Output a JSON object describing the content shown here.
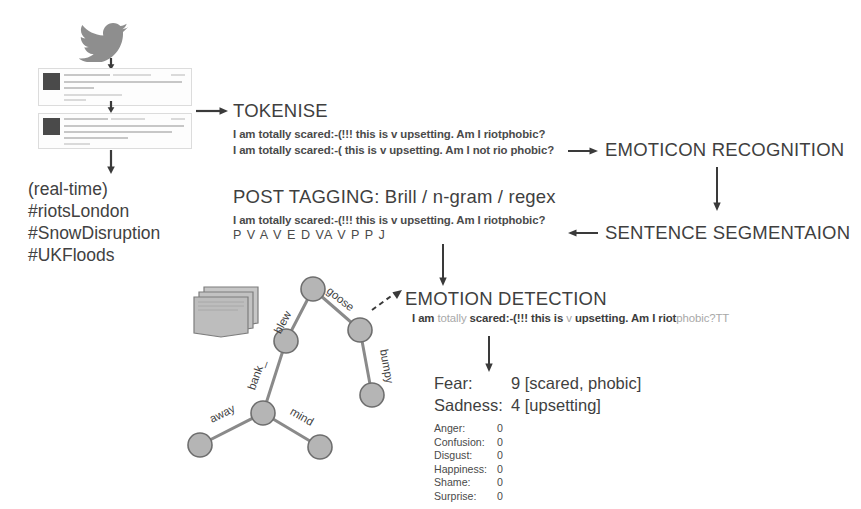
{
  "diagram": {
    "colors": {
      "text": "#3a3a3a",
      "node_fill": "#b5b5b5",
      "node_stroke": "#6e6e6e",
      "arrow": "#3a3a3a",
      "dim_text": "#a8a8a8",
      "doc_fill": "#bdbdbd"
    }
  },
  "source": {
    "logo_name": "twitter-bird-icon",
    "tweets": [
      {
        "id": 1,
        "caption": "tweet screenshot (blurred)"
      },
      {
        "id": 2,
        "caption": "tweet screenshot (blurred)"
      }
    ],
    "stream_lines": [
      "(real-time)",
      "#riotsLondon",
      "#SnowDisruption",
      "#UKFloods"
    ]
  },
  "stages": {
    "tokenise": {
      "title": "TOKENISE",
      "lines": [
        "I am totally scared:-(!!! this is v upsetting. Am I riotphobic?",
        "I am totally scared:-( this is v upsetting. Am I not rio phobic?"
      ]
    },
    "emoticon_recognition": {
      "title": "EMOTICON RECOGNITION"
    },
    "sentence_segmentation": {
      "title": "SENTENCE SEGMENTAION"
    },
    "post_tagging": {
      "title": "POST TAGGING: Brill / n-gram / regex",
      "sentence": "I am totally scared:-(!!! this is v upsetting. Am I riotphobic?",
      "tags": "P V   A        V     E     D  VA  V      P  P    J",
      "tag_list": [
        "P",
        "V",
        "A",
        "V",
        "E",
        "D",
        "V",
        "A",
        "V",
        "P",
        "P",
        "J"
      ]
    },
    "emotion_detection": {
      "title": "EMOTION DETECTION",
      "sentence_parts": [
        {
          "text": "I am ",
          "style": "bold"
        },
        {
          "text": "totally ",
          "style": "dim"
        },
        {
          "text": "scared:-(!!! this is ",
          "style": "bold"
        },
        {
          "text": "v ",
          "style": "dim"
        },
        {
          "text": "upsetting. Am I riot",
          "style": "bold"
        },
        {
          "text": "phobic?TT",
          "style": "dim"
        }
      ]
    }
  },
  "results": {
    "primary": [
      {
        "label": "Fear:",
        "score": "9",
        "evidence": "[scared, phobic]"
      },
      {
        "label": "Sadness:",
        "score": "4",
        "evidence": "[upsetting]"
      }
    ],
    "secondary": [
      {
        "label": "Anger:",
        "score": "0"
      },
      {
        "label": "Confusion:",
        "score": "0"
      },
      {
        "label": "Disgust:",
        "score": "0"
      },
      {
        "label": "Happiness:",
        "score": "0"
      },
      {
        "label": "Shame:",
        "score": "0"
      },
      {
        "label": "Surprise:",
        "score": "0"
      }
    ]
  },
  "tree": {
    "caption": "word association / parse tree",
    "edge_labels": [
      "blew",
      "goose",
      "bumpy",
      "bank_",
      "away",
      "mind"
    ],
    "nodes": [
      {
        "id": "root",
        "cx": 135,
        "cy": 17,
        "r": 12
      },
      {
        "id": "left",
        "cx": 108,
        "cy": 69,
        "r": 12
      },
      {
        "id": "right",
        "cx": 182,
        "cy": 58,
        "r": 12
      },
      {
        "id": "bumpy",
        "cx": 194,
        "cy": 123,
        "r": 12
      },
      {
        "id": "bank",
        "cx": 85,
        "cy": 141,
        "r": 12
      },
      {
        "id": "away",
        "cx": 22,
        "cy": 173,
        "r": 12
      },
      {
        "id": "mind",
        "cx": 142,
        "cy": 175,
        "r": 12
      }
    ]
  }
}
